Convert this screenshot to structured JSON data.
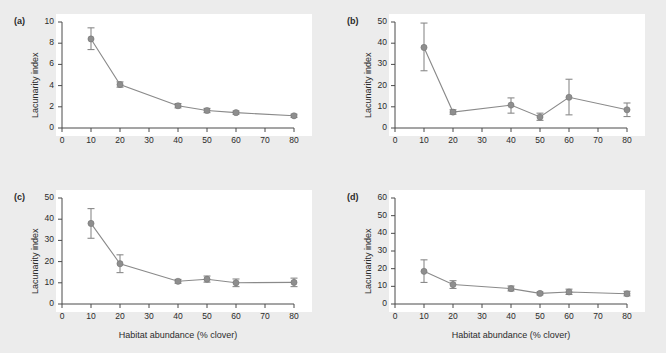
{
  "figure": {
    "background_color": "#ececec",
    "plot_background_color": "#ffffff",
    "marker_color": "#8e8e8e",
    "line_color": "#8a8a8a",
    "axis_color": "#4a4a4a"
  },
  "chart_data": [
    {
      "type": "line",
      "panel_label": "(a)",
      "title": "",
      "xlabel": "",
      "ylabel": "Lacunarity index",
      "x": [
        10,
        20,
        40,
        50,
        60,
        80
      ],
      "values": [
        8.4,
        4.1,
        2.1,
        1.65,
        1.45,
        1.15
      ],
      "yerr_low": [
        7.4,
        3.85,
        1.9,
        1.45,
        1.3,
        1.0
      ],
      "yerr_high": [
        9.45,
        4.35,
        2.3,
        1.85,
        1.6,
        1.3
      ],
      "xlim": [
        0,
        80
      ],
      "ylim": [
        0,
        10
      ],
      "xticks": [
        0,
        10,
        20,
        30,
        40,
        50,
        60,
        70,
        80
      ],
      "yticks": [
        0,
        2,
        4,
        6,
        8,
        10
      ],
      "xticklabels": [
        "0",
        "10",
        "20",
        "30",
        "40",
        "50",
        "60",
        "70",
        "80"
      ],
      "yticklabels": [
        "0",
        "2",
        "4",
        "6",
        "8",
        "10"
      ],
      "grid": false,
      "legend": "none",
      "errorbars": true
    },
    {
      "type": "line",
      "panel_label": "(b)",
      "title": "",
      "xlabel": "",
      "ylabel": "Lacunarity index",
      "x": [
        10,
        20,
        40,
        50,
        60,
        80
      ],
      "values": [
        38.0,
        7.5,
        10.8,
        5.2,
        14.5,
        8.6
      ],
      "yerr_low": [
        27.0,
        6.5,
        7.0,
        3.6,
        6.2,
        5.4
      ],
      "yerr_high": [
        49.5,
        8.6,
        14.2,
        7.0,
        23.0,
        11.8
      ],
      "xlim": [
        0,
        80
      ],
      "ylim": [
        0,
        50
      ],
      "xticks": [
        0,
        10,
        20,
        30,
        40,
        50,
        60,
        70,
        80
      ],
      "yticks": [
        0,
        10,
        20,
        30,
        40,
        50
      ],
      "xticklabels": [
        "0",
        "10",
        "20",
        "30",
        "40",
        "50",
        "60",
        "70",
        "80"
      ],
      "yticklabels": [
        "0",
        "10",
        "20",
        "30",
        "40",
        "50"
      ],
      "grid": false,
      "legend": "none",
      "errorbars": true
    },
    {
      "type": "line",
      "panel_label": "(c)",
      "title": "",
      "xlabel": "Habitat abundance (% clover)",
      "ylabel": "Lacunarity index",
      "x": [
        10,
        20,
        40,
        50,
        60,
        80
      ],
      "values": [
        38.0,
        19.0,
        10.7,
        11.7,
        10.0,
        10.2
      ],
      "yerr_low": [
        31.0,
        14.8,
        9.8,
        10.3,
        8.2,
        8.2
      ],
      "yerr_high": [
        45.0,
        23.2,
        11.6,
        13.2,
        11.8,
        12.2
      ],
      "xlim": [
        0,
        80
      ],
      "ylim": [
        0,
        50
      ],
      "xticks": [
        0,
        10,
        20,
        30,
        40,
        50,
        60,
        70,
        80
      ],
      "yticks": [
        0,
        10,
        20,
        30,
        40,
        50
      ],
      "xticklabels": [
        "0",
        "10",
        "20",
        "30",
        "40",
        "50",
        "60",
        "70",
        "80"
      ],
      "yticklabels": [
        "0",
        "10",
        "20",
        "30",
        "40",
        "50"
      ],
      "grid": false,
      "legend": "none",
      "errorbars": true
    },
    {
      "type": "line",
      "panel_label": "(d)",
      "title": "",
      "xlabel": "Habitat abundance (% clover)",
      "ylabel": "Lacunarity index",
      "x": [
        10,
        20,
        40,
        50,
        60,
        80
      ],
      "values": [
        18.5,
        11.0,
        8.7,
        6.0,
        6.8,
        5.8
      ],
      "yerr_low": [
        12.2,
        8.8,
        7.4,
        5.2,
        5.4,
        4.6
      ],
      "yerr_high": [
        25.0,
        13.2,
        10.2,
        6.8,
        8.4,
        7.2
      ],
      "xlim": [
        0,
        80
      ],
      "ylim": [
        0,
        60
      ],
      "xticks": [
        0,
        10,
        20,
        30,
        40,
        50,
        60,
        70,
        80
      ],
      "yticks": [
        0,
        10,
        20,
        30,
        40,
        50,
        60
      ],
      "xticklabels": [
        "0",
        "10",
        "20",
        "30",
        "40",
        "50",
        "60",
        "70",
        "80"
      ],
      "yticklabels": [
        "0",
        "10",
        "20",
        "30",
        "40",
        "50",
        "60"
      ],
      "grid": false,
      "legend": "none",
      "errorbars": true
    }
  ]
}
